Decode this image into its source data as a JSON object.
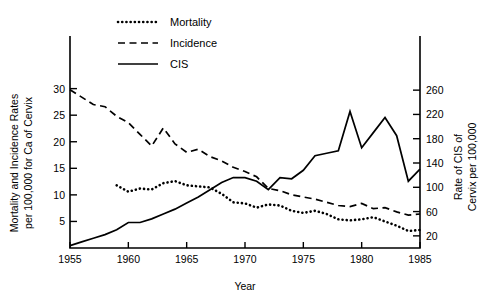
{
  "chart_data": {
    "type": "line",
    "title": "",
    "xlabel": "Year",
    "ylabel_left": "Mortality and Incidence Rates\nper 100,000 for Ca of Cervix",
    "ylabel_left_line1": "Mortality and Incidence Rates",
    "ylabel_left_line2": "per 100,000 for Ca of Cervix",
    "ylabel_right_line1": "Rate of CIS of",
    "ylabel_right_line2": "Cervix per 100,000",
    "xlim": [
      1955,
      1985
    ],
    "xticks": [
      1955,
      1960,
      1965,
      1970,
      1975,
      1980,
      1985
    ],
    "xticklabels": [
      "1955",
      "1960",
      "1965",
      "1970",
      "1975",
      "1980",
      "1985"
    ],
    "ylim_left": [
      0,
      32
    ],
    "yticks_left": [
      5,
      10,
      15,
      20,
      25,
      30
    ],
    "yticklabels_left": [
      "5",
      "10",
      "15",
      "20",
      "25",
      "30"
    ],
    "ylim_right": [
      0,
      280
    ],
    "yticks_right": [
      20,
      60,
      100,
      140,
      180,
      220,
      260
    ],
    "yticklabels_right": [
      "20",
      "60",
      "100",
      "140",
      "180",
      "220",
      "260"
    ],
    "grid": false,
    "legend_position": "top-left",
    "series": [
      {
        "name": "Mortality",
        "style": "dotted",
        "axis": "left",
        "x": [
          1959,
          1960,
          1961,
          1962,
          1963,
          1964,
          1965,
          1966,
          1967,
          1968,
          1969,
          1970,
          1971,
          1972,
          1973,
          1974,
          1975,
          1976,
          1977,
          1978,
          1979,
          1980,
          1981,
          1982,
          1983,
          1984,
          1985
        ],
        "values": [
          11.8,
          10.6,
          11.2,
          11.0,
          12.2,
          12.6,
          11.8,
          11.6,
          11.4,
          10.2,
          8.6,
          8.4,
          7.6,
          8.2,
          8.0,
          7.0,
          6.6,
          7.0,
          6.4,
          5.4,
          5.2,
          5.4,
          5.8,
          5.0,
          4.2,
          3.2,
          3.4
        ]
      },
      {
        "name": "Incidence",
        "style": "dashed",
        "axis": "left",
        "x": [
          1955,
          1956,
          1957,
          1958,
          1959,
          1960,
          1961,
          1962,
          1963,
          1964,
          1965,
          1966,
          1967,
          1968,
          1969,
          1970,
          1971,
          1972,
          1973,
          1974,
          1975,
          1976,
          1977,
          1978,
          1979,
          1980,
          1981,
          1982,
          1983,
          1984,
          1985
        ],
        "values": [
          29.8,
          28.4,
          27.0,
          26.6,
          24.8,
          23.6,
          21.4,
          19.2,
          22.6,
          19.6,
          18.0,
          18.6,
          17.2,
          16.4,
          15.2,
          14.4,
          13.4,
          11.2,
          10.8,
          10.0,
          9.6,
          9.2,
          8.6,
          8.0,
          7.8,
          8.4,
          7.4,
          7.6,
          6.8,
          6.2,
          6.4
        ]
      },
      {
        "name": "CIS",
        "style": "solid",
        "axis": "right",
        "x": [
          1955,
          1956,
          1957,
          1958,
          1959,
          1960,
          1961,
          1962,
          1963,
          1964,
          1965,
          1966,
          1967,
          1968,
          1969,
          1970,
          1971,
          1972,
          1973,
          1974,
          1975,
          1976,
          1977,
          1978,
          1979,
          1980,
          1981,
          1982,
          1983,
          1984,
          1985
        ],
        "values": [
          4,
          10,
          16,
          22,
          30,
          42,
          42,
          48,
          56,
          64,
          74,
          84,
          96,
          108,
          116,
          116,
          110,
          96,
          116,
          114,
          128,
          152,
          156,
          160,
          225,
          165,
          190,
          215,
          185,
          110,
          130
        ]
      }
    ],
    "legend": [
      {
        "label": "Mortality",
        "style": "dotted"
      },
      {
        "label": "Incidence",
        "style": "dashed"
      },
      {
        "label": "CIS",
        "style": "solid"
      }
    ]
  }
}
